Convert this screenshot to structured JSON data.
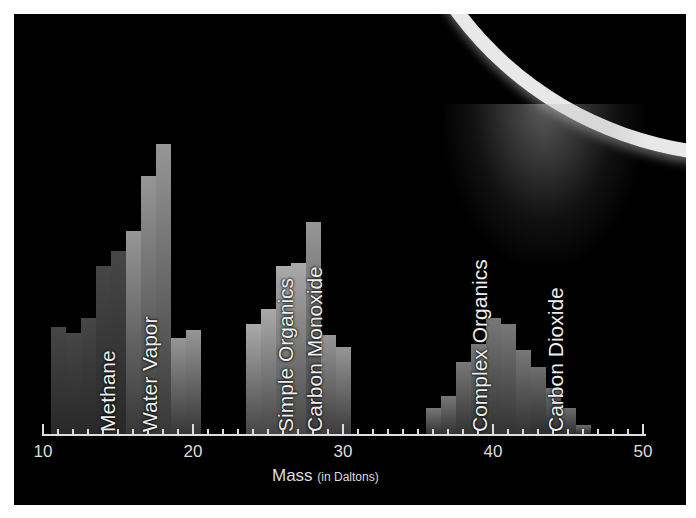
{
  "chart_data": {
    "type": "bar",
    "title": "",
    "xlabel": "Mass",
    "xlabel_unit": "(in Daltons)",
    "xlim": [
      10,
      50
    ],
    "xticks": [
      10,
      20,
      30,
      40,
      50
    ],
    "grid": false,
    "background_image": "Enceladus plume over limb",
    "series": [
      {
        "name": "Methane",
        "x": [
          11,
          12,
          13,
          14,
          15,
          16
        ],
        "values": [
          37,
          35,
          40,
          58,
          63,
          60
        ]
      },
      {
        "name": "Water Vapor",
        "x": [
          16,
          17,
          18,
          19,
          20
        ],
        "values": [
          70,
          89,
          100,
          33,
          36
        ]
      },
      {
        "name": "Simple Organics",
        "x": [
          24,
          25,
          26,
          27
        ],
        "values": [
          38,
          43,
          58,
          59
        ]
      },
      {
        "name": "Carbon Monoxide",
        "x": [
          28,
          29,
          30
        ],
        "values": [
          73,
          34,
          30
        ]
      },
      {
        "name": "Complex Organics",
        "x": [
          36,
          37,
          38,
          39,
          40,
          41,
          42
        ],
        "values": [
          9,
          13,
          25,
          31,
          40,
          38,
          29
        ]
      },
      {
        "name": "Carbon Dioxide",
        "x": [
          43,
          44,
          45,
          46
        ],
        "values": [
          23,
          16,
          9,
          3
        ]
      }
    ]
  },
  "labels": {
    "methane": "Methane",
    "water": "Water Vapor",
    "simple": "Simple Organics",
    "co": "Carbon Monoxide",
    "complex": "Complex Organics",
    "co2": "Carbon Dioxide"
  },
  "axis": {
    "t10": "10",
    "t20": "20",
    "t30": "30",
    "t40": "40",
    "t50": "50",
    "label": "Mass",
    "unit": "(in Daltons)"
  }
}
